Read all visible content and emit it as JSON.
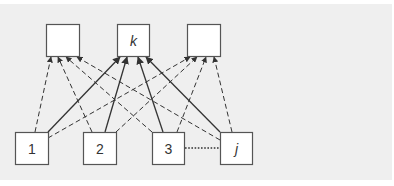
{
  "diagram": {
    "type": "bipartite-network",
    "colors": {
      "background": "#ffffff",
      "panel": "#efefef",
      "node_fill": "#ffffff",
      "node_stroke": "#555555",
      "edge": "#333333"
    },
    "top_nodes": [
      {
        "id": "top-left",
        "label": "",
        "x": 46,
        "y": 24,
        "w": 33,
        "h": 32
      },
      {
        "id": "k",
        "label": "k",
        "x": 117,
        "y": 24,
        "w": 32,
        "h": 32
      },
      {
        "id": "top-right",
        "label": "",
        "x": 187,
        "y": 24,
        "w": 33,
        "h": 32
      }
    ],
    "bottom_nodes": [
      {
        "id": "1",
        "label": "1",
        "x": 15,
        "y": 132,
        "w": 33,
        "h": 32
      },
      {
        "id": "2",
        "label": "2",
        "x": 83,
        "y": 132,
        "w": 33,
        "h": 32
      },
      {
        "id": "3",
        "label": "3",
        "x": 152,
        "y": 132,
        "w": 32,
        "h": 32
      },
      {
        "id": "j",
        "label": "j",
        "x": 220,
        "y": 132,
        "w": 32,
        "h": 32
      }
    ],
    "edges": [
      {
        "from": "1",
        "to": "top-left",
        "style": "dashed",
        "x1": 35,
        "y1": 132,
        "x2": 51,
        "y2": 57
      },
      {
        "from": "1",
        "to": "k",
        "style": "solid",
        "x1": 48,
        "y1": 132,
        "x2": 120,
        "y2": 57
      },
      {
        "from": "1",
        "to": "top-right",
        "style": "dashed",
        "x1": 48,
        "y1": 138,
        "x2": 190,
        "y2": 57
      },
      {
        "from": "2",
        "to": "top-left",
        "style": "dashed",
        "x1": 92,
        "y1": 132,
        "x2": 58,
        "y2": 57
      },
      {
        "from": "2",
        "to": "k",
        "style": "solid",
        "x1": 105,
        "y1": 132,
        "x2": 127,
        "y2": 57
      },
      {
        "from": "2",
        "to": "top-right",
        "style": "dashed",
        "x1": 116,
        "y1": 132,
        "x2": 197,
        "y2": 57
      },
      {
        "from": "3",
        "to": "top-left",
        "style": "dashed",
        "x1": 152,
        "y1": 132,
        "x2": 66,
        "y2": 57
      },
      {
        "from": "3",
        "to": "k",
        "style": "solid",
        "x1": 163,
        "y1": 132,
        "x2": 138,
        "y2": 57
      },
      {
        "from": "3",
        "to": "top-right",
        "style": "dashed",
        "x1": 177,
        "y1": 132,
        "x2": 206,
        "y2": 57
      },
      {
        "from": "j",
        "to": "top-left",
        "style": "dashed",
        "x1": 220,
        "y1": 140,
        "x2": 77,
        "y2": 57
      },
      {
        "from": "j",
        "to": "k",
        "style": "solid",
        "x1": 220,
        "y1": 132,
        "x2": 146,
        "y2": 57
      },
      {
        "from": "j",
        "to": "top-right",
        "style": "dashed",
        "x1": 232,
        "y1": 132,
        "x2": 214,
        "y2": 57
      }
    ],
    "ellipsis_connector": {
      "from": "3",
      "to": "j",
      "style": "dotted",
      "x1": 185,
      "y1": 148,
      "x2": 219,
      "y2": 148
    }
  }
}
